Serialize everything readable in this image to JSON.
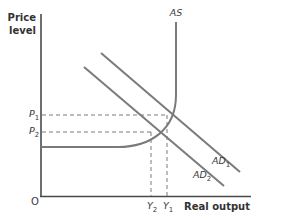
{
  "diagram": {
    "type": "AD-AS shift",
    "axes": {
      "y_label_line1": "Price",
      "y_label_line2": "level",
      "x_label": "Real output",
      "origin": "O"
    },
    "curves": {
      "as": {
        "label": "AS"
      },
      "ad1": {
        "label_main": "AD",
        "label_sub": "1"
      },
      "ad2": {
        "label_main": "AD",
        "label_sub": "2"
      }
    },
    "price_levels": {
      "p1": {
        "main": "P",
        "sub": "1"
      },
      "p2": {
        "main": "P",
        "sub": "2"
      }
    },
    "outputs": {
      "y1": {
        "main": "Y",
        "sub": "1"
      },
      "y2": {
        "main": "Y",
        "sub": "2"
      }
    },
    "colors": {
      "axis": "#4a4a4a",
      "curve": "#7a7a7a",
      "dashed": "#7a7a7a",
      "text": "#3a3a3a"
    }
  }
}
